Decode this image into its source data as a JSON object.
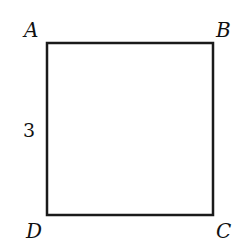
{
  "diagram": {
    "shape": "square",
    "vertices": [
      {
        "label": "A",
        "x": 47,
        "y": 43
      },
      {
        "label": "B",
        "x": 213,
        "y": 43
      },
      {
        "label": "C",
        "x": 213,
        "y": 215
      },
      {
        "label": "D",
        "x": 47,
        "y": 215
      }
    ],
    "side_label": {
      "text": "3",
      "side": "AD"
    },
    "colors": {
      "stroke": "#1a1a1a",
      "background": "#ffffff"
    }
  }
}
